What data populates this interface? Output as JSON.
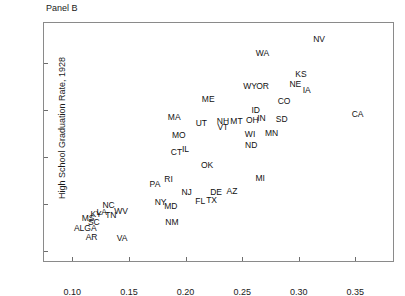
{
  "panel": {
    "title": "Panel B"
  },
  "chart_data": {
    "type": "scatter",
    "title": "Panel B",
    "xlabel": "",
    "ylabel": "High School Graduation Rate, 1928",
    "xlim": [
      0.075,
      0.385
    ],
    "ylim": [
      0.075,
      0.585
    ],
    "xticks": [
      "0.10",
      "0.15",
      "0.20",
      "0.25",
      "0.30",
      "0.35"
    ],
    "xtick_values": [
      0.1,
      0.15,
      0.2,
      0.25,
      0.3,
      0.35
    ],
    "yticks": [
      "0.1",
      "0.2",
      "0.3",
      "0.4",
      "0.5"
    ],
    "ytick_values": [
      0.1,
      0.2,
      0.3,
      0.4,
      0.5
    ],
    "grid": false,
    "legend": null,
    "marker_style": "text-label",
    "points": [
      {
        "label": "NV",
        "x": 0.318,
        "y": 0.552
      },
      {
        "label": "WA",
        "x": 0.268,
        "y": 0.522
      },
      {
        "label": "KS",
        "x": 0.302,
        "y": 0.477
      },
      {
        "label": "NE",
        "x": 0.297,
        "y": 0.455
      },
      {
        "label": "OR",
        "x": 0.268,
        "y": 0.452
      },
      {
        "label": "WY",
        "x": 0.257,
        "y": 0.451
      },
      {
        "label": "IA",
        "x": 0.307,
        "y": 0.443
      },
      {
        "label": "ME",
        "x": 0.22,
        "y": 0.424
      },
      {
        "label": "CO",
        "x": 0.287,
        "y": 0.42
      },
      {
        "label": "ID",
        "x": 0.262,
        "y": 0.4
      },
      {
        "label": "CA",
        "x": 0.352,
        "y": 0.392
      },
      {
        "label": "MA",
        "x": 0.19,
        "y": 0.385
      },
      {
        "label": "SD",
        "x": 0.285,
        "y": 0.382
      },
      {
        "label": "IN",
        "x": 0.267,
        "y": 0.384
      },
      {
        "label": "OH",
        "x": 0.259,
        "y": 0.378
      },
      {
        "label": "MT",
        "x": 0.245,
        "y": 0.376
      },
      {
        "label": "NH",
        "x": 0.233,
        "y": 0.376
      },
      {
        "label": "UT",
        "x": 0.214,
        "y": 0.372
      },
      {
        "label": "VT",
        "x": 0.233,
        "y": 0.365
      },
      {
        "label": "MN",
        "x": 0.276,
        "y": 0.352
      },
      {
        "label": "WI",
        "x": 0.257,
        "y": 0.35
      },
      {
        "label": "MO",
        "x": 0.194,
        "y": 0.348
      },
      {
        "label": "ND",
        "x": 0.258,
        "y": 0.326
      },
      {
        "label": "IL",
        "x": 0.2,
        "y": 0.317
      },
      {
        "label": "CT",
        "x": 0.192,
        "y": 0.31
      },
      {
        "label": "OK",
        "x": 0.219,
        "y": 0.283
      },
      {
        "label": "MI",
        "x": 0.266,
        "y": 0.256
      },
      {
        "label": "RI",
        "x": 0.185,
        "y": 0.253
      },
      {
        "label": "PA",
        "x": 0.173,
        "y": 0.243
      },
      {
        "label": "AZ",
        "x": 0.241,
        "y": 0.229
      },
      {
        "label": "DE",
        "x": 0.227,
        "y": 0.225
      },
      {
        "label": "NJ",
        "x": 0.201,
        "y": 0.225
      },
      {
        "label": "TX",
        "x": 0.223,
        "y": 0.208
      },
      {
        "label": "FL",
        "x": 0.213,
        "y": 0.207
      },
      {
        "label": "NY",
        "x": 0.178,
        "y": 0.204
      },
      {
        "label": "NC",
        "x": 0.132,
        "y": 0.199
      },
      {
        "label": "MD",
        "x": 0.187,
        "y": 0.196
      },
      {
        "label": "WV",
        "x": 0.143,
        "y": 0.186
      },
      {
        "label": "LA",
        "x": 0.126,
        "y": 0.184
      },
      {
        "label": "KY",
        "x": 0.121,
        "y": 0.18
      },
      {
        "label": "TN",
        "x": 0.134,
        "y": 0.176
      },
      {
        "label": "MS",
        "x": 0.114,
        "y": 0.171
      },
      {
        "label": "SC",
        "x": 0.119,
        "y": 0.163
      },
      {
        "label": "NM",
        "x": 0.188,
        "y": 0.163
      },
      {
        "label": "GA",
        "x": 0.116,
        "y": 0.15
      },
      {
        "label": "AL",
        "x": 0.106,
        "y": 0.149
      },
      {
        "label": "AR",
        "x": 0.117,
        "y": 0.131
      },
      {
        "label": "VA",
        "x": 0.144,
        "y": 0.128
      }
    ]
  }
}
